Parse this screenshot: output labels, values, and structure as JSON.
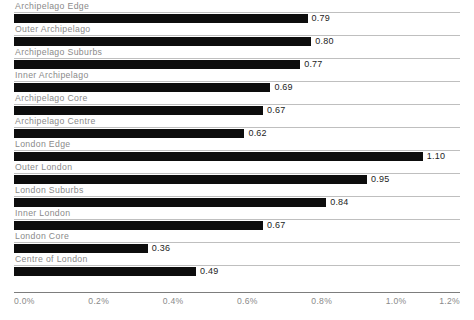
{
  "chart_data": {
    "type": "bar",
    "orientation": "horizontal",
    "title": "",
    "subtitle": "",
    "xlabel": "",
    "ylabel": "",
    "xlim": [
      0,
      1.2
    ],
    "grid": true,
    "legend": null,
    "value_format": "two-decimal",
    "axis_unit": "percent",
    "categories": [
      "Archipelago Edge",
      "Outer Archipelago",
      "Archipelago Suburbs",
      "Inner Archipelago",
      "Archipelago Core",
      "Archipelago Centre",
      "London Edge",
      "Outer London",
      "London Suburbs",
      "Inner London",
      "London Core",
      "Centre of London"
    ],
    "values": [
      0.79,
      0.8,
      0.77,
      0.69,
      0.67,
      0.62,
      1.1,
      0.95,
      0.84,
      0.67,
      0.36,
      0.49
    ],
    "value_labels": [
      "0.79",
      "0.80",
      "0.77",
      "0.69",
      "0.67",
      "0.62",
      "1.10",
      "0.95",
      "0.84",
      "0.67",
      "0.36",
      "0.49"
    ],
    "xticks": [
      0.0,
      0.2,
      0.4,
      0.6,
      0.8,
      1.0,
      1.2
    ],
    "xtick_labels": [
      "0.0%",
      "0.2%",
      "0.4%",
      "0.6%",
      "0.8%",
      "1.0%",
      "1.2%"
    ],
    "colors": {
      "bar": "#0d0d0d",
      "gridline": "#bfbfbf",
      "axis_line": "#7d7d7d",
      "category_label": "#8a8a8a",
      "value_label": "#1c1c1c",
      "tick_label": "#8a8a8a",
      "background": "#ffffff"
    }
  }
}
